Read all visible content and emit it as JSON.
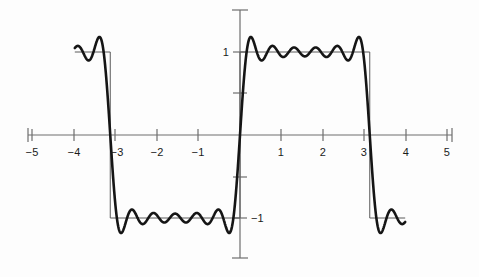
{
  "figure": {
    "title": "",
    "background_color": "#fdfdfd",
    "axis_color": "#6e6e6e",
    "square_wave_color": "#5a5a5a",
    "fourier_curve_color": "#151515",
    "tick_color": "#6e6e6e",
    "label_color": "#1b1b1b"
  },
  "axes": {
    "x_axis_name": "x-axis",
    "y_axis_name": "y-axis",
    "origin_px": {
      "x": 240,
      "y": 135
    },
    "x_unit_px": 41.3,
    "y_unit_px": 83.0,
    "x_axis_span_px": {
      "left": 28,
      "right": 452
    },
    "y_axis_span_px": {
      "top": 10,
      "bottom": 258
    }
  },
  "chart_data": {
    "type": "line",
    "title": "",
    "subtitle": "",
    "xlabel": "",
    "ylabel": "",
    "xlim": [
      -5,
      5
    ],
    "ylim": [
      -1.5,
      1.5
    ],
    "grid": false,
    "legend_position": "none",
    "x_ticks": [
      -5,
      -4,
      -3,
      -2,
      -1,
      1,
      2,
      3,
      4,
      5
    ],
    "x_tick_labels": [
      "−5",
      "−4",
      "−3",
      "−2",
      "−1",
      "1",
      "2",
      "3",
      "4",
      "5"
    ],
    "y_ticks": [
      1,
      0.5,
      -0.5,
      -1
    ],
    "y_tick_labels_shown": [
      "1",
      "−1"
    ],
    "y_label_1": "1",
    "y_label_neg1": "−1",
    "y_label_1_value": 1,
    "y_label_neg1_value": -1,
    "series": [
      {
        "name": "square-wave",
        "style": "thin",
        "description": "Ideal square wave, period 2π, amplitude 1, discontinuities at x = −π and x = π",
        "period": 6.2832,
        "amplitude": 1,
        "discontinuities": [
          -3.1416,
          0,
          3.1416
        ],
        "x_start": -4.0,
        "x_end": 4.0,
        "values_description": "+1 on (−2π, −π) and (0, π); −1 on (−π, 0) and (π, 2π)"
      },
      {
        "name": "fourier-partial-sum",
        "style": "thick",
        "description": "Fourier partial sum of the square wave showing Gibbs phenomenon overshoot",
        "harmonics": [
          1,
          3,
          5,
          7,
          9,
          11
        ],
        "n_terms": 6,
        "highest_harmonic": 11,
        "formula": "(4/π) Σ sin(n x)/n, n odd up to 11",
        "overshoot_peak": 1.17,
        "undershoot_peak": -1.17,
        "x_start": -4.0,
        "x_end": 4.0
      }
    ]
  }
}
